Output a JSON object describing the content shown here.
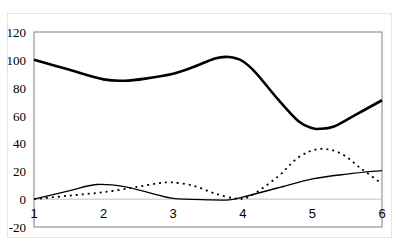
{
  "chart_data": {
    "type": "line",
    "title": "",
    "xlabel": "",
    "ylabel": "",
    "xlim": [
      1,
      6
    ],
    "ylim": [
      -20,
      120
    ],
    "x_ticks": [
      "1",
      "2",
      "3",
      "4",
      "5",
      "6"
    ],
    "y_ticks": [
      "-20",
      "0",
      "20",
      "40",
      "60",
      "80",
      "100",
      "120"
    ],
    "grid": false,
    "legend": "none",
    "series": [
      {
        "name": "thick-solid",
        "style": "solid-thick",
        "color": "#000000",
        "x": [
          1,
          1.5,
          2,
          2.3,
          2.6,
          3,
          3.3,
          3.6,
          3.8,
          4,
          4.2,
          4.5,
          4.8,
          5,
          5.1,
          5.3,
          5.6,
          6
        ],
        "y": [
          100,
          93,
          86,
          85,
          86.5,
          90,
          95,
          101,
          102,
          99,
          90,
          72,
          56,
          51,
          50.5,
          52,
          60,
          71
        ]
      },
      {
        "name": "thin-solid",
        "style": "solid-thin",
        "color": "#000000",
        "x": [
          1,
          1.5,
          1.9,
          2.3,
          2.7,
          3,
          3.5,
          3.8,
          4,
          4.5,
          5,
          5.5,
          6
        ],
        "y": [
          0,
          6,
          10.5,
          9,
          4,
          0.5,
          -0.5,
          -0.5,
          1.5,
          8,
          14.5,
          18,
          20.5
        ]
      },
      {
        "name": "dotted",
        "style": "dotted",
        "color": "#000000",
        "x": [
          1,
          1.5,
          2,
          2.5,
          2.8,
          3,
          3.3,
          3.6,
          3.9,
          4.1,
          4.5,
          4.8,
          5.1,
          5.4,
          5.7,
          6
        ],
        "y": [
          0,
          2.5,
          5,
          9,
          11.5,
          12,
          9.5,
          4,
          0.5,
          2,
          16,
          30,
          36,
          33,
          22,
          11
        ]
      }
    ]
  }
}
